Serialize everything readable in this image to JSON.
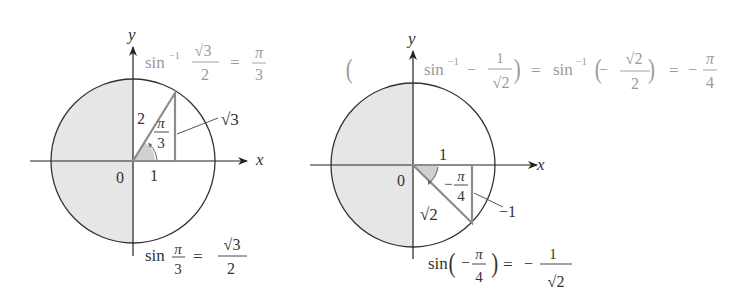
{
  "figure": {
    "left": {
      "axes": {
        "x_label": "x",
        "y_label": "y",
        "origin_label": "0"
      },
      "triangle": {
        "hypotenuse_label": "2",
        "adjacent_label": "1",
        "opposite_label": "√3",
        "angle_label": {
          "numerator": "π",
          "denominator": "3"
        }
      },
      "top_equation": {
        "fn": "sin",
        "superscript": "−1",
        "arg": {
          "numerator": "√3",
          "denominator": "2"
        },
        "equals": "=",
        "result": {
          "numerator": "π",
          "denominator": "3"
        }
      },
      "bottom_equation": {
        "fn": "sin",
        "arg": {
          "numerator": "π",
          "denominator": "3"
        },
        "equals": "=",
        "result": {
          "numerator": "√3",
          "denominator": "2"
        }
      }
    },
    "right": {
      "axes": {
        "x_label": "x",
        "y_label": "y",
        "origin_label": "0"
      },
      "triangle": {
        "hypotenuse_label": "√2",
        "adjacent_label": "1",
        "opposite_label": "−1",
        "angle_label": {
          "sign": "−",
          "numerator": "π",
          "denominator": "4"
        }
      },
      "top_equation": {
        "fn1": "sin",
        "sup1": "−1",
        "arg1": {
          "sign": "−",
          "numerator": "1",
          "denominator": "√2"
        },
        "equals1": "=",
        "fn2": "sin",
        "sup2": "−1",
        "arg2": {
          "sign": "−",
          "numerator": "√2",
          "denominator": "2"
        },
        "equals2": "=",
        "result": {
          "sign": "−",
          "numerator": "π",
          "denominator": "4"
        }
      },
      "bottom_equation": {
        "fn": "sin",
        "arg": {
          "sign": "−",
          "numerator": "π",
          "denominator": "4"
        },
        "equals": "=",
        "result": {
          "sign": "−",
          "numerator": "1",
          "denominator": "√2"
        }
      }
    },
    "colors": {
      "shade": "#e6e6e6",
      "line": "#333333",
      "triangle": "#8c8c8c",
      "top_equation_text": "#9a9a9a",
      "text": "#333333"
    }
  }
}
